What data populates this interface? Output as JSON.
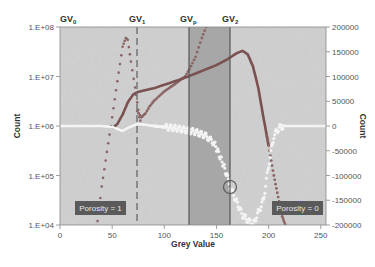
{
  "chart_data": {
    "type": "scatter",
    "title": "",
    "xlabel": "Grey Value",
    "ylabel_left": "Count",
    "ylabel_right": "Count",
    "xlim": [
      0,
      255
    ],
    "x_ticks": [
      "0",
      "50",
      "100",
      "150",
      "200",
      "250"
    ],
    "ylim_left": [
      10000,
      100000000
    ],
    "y_scale_left": "log",
    "y_ticks_left": [
      "1.E+04",
      "1.E+05",
      "1.E+06",
      "1.E+07",
      "1.E+08"
    ],
    "ylim_right": [
      -200000,
      200000
    ],
    "y_ticks_right": [
      "200000",
      "150000",
      "100000",
      "50000",
      "0",
      "-50000",
      "-100000",
      "-150000",
      "-200000"
    ],
    "grid": false,
    "legend": null,
    "threshold_lines": [
      {
        "label": "GV0",
        "label_main": "GV",
        "label_sub": "0",
        "x": 0,
        "style": "none"
      },
      {
        "label": "GV1",
        "label_main": "GV",
        "label_sub": "1",
        "x": 74,
        "style": "dashed"
      },
      {
        "label": "GVp",
        "label_main": "GV",
        "label_sub": "p",
        "x": 124,
        "style": "solid"
      },
      {
        "label": "GV2",
        "label_main": "GV",
        "label_sub": "2",
        "x": 163,
        "style": "solid"
      }
    ],
    "shaded_region": {
      "x_from": 124,
      "x_to": 163
    },
    "annotations": [
      {
        "text": "Porosity = 1",
        "x": 20,
        "y_left": 20000
      },
      {
        "text": "Porosity = 0",
        "x": 215,
        "y_left": 20000
      },
      {
        "type": "circle",
        "x": 163,
        "y_right": -123000
      }
    ],
    "series": [
      {
        "name": "histogram-low-phase (dotted, left axis)",
        "axis": "left",
        "x": [
          36,
          40,
          45,
          50,
          55,
          60,
          63,
          65,
          68,
          72,
          74,
          76,
          78
        ],
        "values": [
          12000,
          60000,
          300000,
          1500000,
          8000000,
          40000000,
          60000000,
          55000000,
          20000000,
          6000000,
          3000000,
          1500000,
          1100000
        ]
      },
      {
        "name": "histogram-mid (solid, left axis)",
        "axis": "left",
        "x": [
          50,
          55,
          60,
          65,
          70,
          74,
          80,
          90,
          100,
          110,
          120,
          130,
          140,
          150,
          160,
          170,
          175,
          180,
          185,
          190,
          195,
          200,
          205,
          210,
          213,
          216
        ],
        "values": [
          900000,
          1100000,
          1700000,
          3000000,
          4300000,
          4800000,
          5200000,
          5800000,
          6800000,
          8000000,
          9500000,
          11500000,
          14000000,
          17000000,
          22000000,
          30000000,
          33000000,
          28000000,
          16000000,
          6000000,
          1500000,
          400000,
          100000,
          30000,
          15000,
          10000
        ]
      },
      {
        "name": "histogram-secondary (dotted, left axis)",
        "axis": "left",
        "x": [
          74,
          78,
          82,
          86,
          90,
          95,
          100,
          110,
          120,
          124,
          130,
          136,
          140
        ],
        "values": [
          2000000,
          1500000,
          1800000,
          2500000,
          3200000,
          4000000,
          5000000,
          7000000,
          10000000,
          14000000,
          25000000,
          60000000,
          100000000
        ]
      },
      {
        "name": "derivative (white dots, right axis)",
        "axis": "right",
        "x": [
          0,
          20,
          40,
          50,
          55,
          60,
          65,
          74,
          80,
          90,
          100,
          110,
          120,
          130,
          140,
          148,
          152,
          156,
          160,
          163,
          175,
          185,
          195,
          200,
          205,
          210,
          215,
          220,
          230,
          255
        ],
        "values": [
          0,
          0,
          0,
          -2000,
          -6000,
          -10000,
          -4000,
          4000,
          3000,
          0,
          -2000,
          -4000,
          -8000,
          -12000,
          -20000,
          -35000,
          -55000,
          -75000,
          -100000,
          -123000,
          -180000,
          -200000,
          -150000,
          -80000,
          -20000,
          -3000,
          0,
          0,
          0,
          0
        ]
      }
    ]
  },
  "colors": {
    "plot_bg": "#c9c9c9",
    "shaded_region": "#a9a9a9",
    "line_dark": "#555555",
    "curve_red": "#7a5050",
    "curve_dotted": "#8a6464",
    "white_curve": "#f4f4f4",
    "badge_bg": "#5a5a5a",
    "badge_text": "#eeeeee"
  },
  "labels": {
    "x_axis": "Grey Value",
    "y_axis_left": "Count",
    "y_axis_right": "Count",
    "porosity_one": "Porosity = 1",
    "porosity_zero": "Porosity = 0",
    "gv0_main": "GV",
    "gv0_sub": "0",
    "gv1_main": "GV",
    "gv1_sub": "1",
    "gvp_main": "GV",
    "gvp_sub": "p",
    "gv2_main": "GV",
    "gv2_sub": "2"
  }
}
